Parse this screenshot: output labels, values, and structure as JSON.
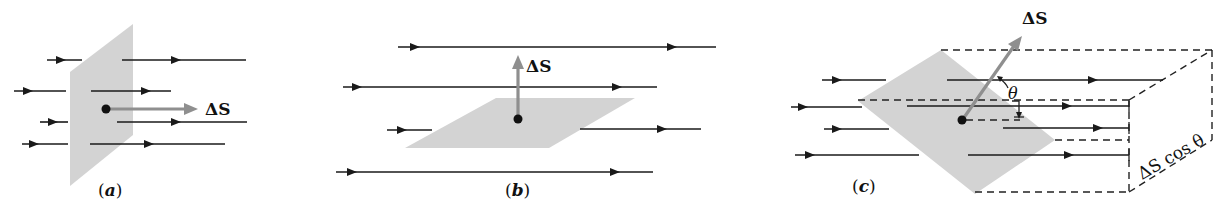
{
  "figure": {
    "panels": [
      {
        "id": "a",
        "caption_open": "(",
        "caption_letter": "a",
        "caption_close": ")",
        "vector_label": "ΔS",
        "description": "Surface perpendicular to field lines; area vector parallel to field"
      },
      {
        "id": "b",
        "caption_open": "(",
        "caption_letter": "b",
        "caption_close": ")",
        "vector_label": "ΔS",
        "description": "Surface parallel to field lines; area vector perpendicular to field"
      },
      {
        "id": "c",
        "caption_open": "(",
        "caption_letter": "c",
        "caption_close": ")",
        "vector_label": "ΔS",
        "angle_label": "θ",
        "projection_label": "ΔS cos θ",
        "description": "Surface tilted at angle θ; projected area ΔS cos θ"
      }
    ],
    "colors": {
      "plane": "#d3d3d3",
      "vector": "#8f8f8f",
      "lines": "#1a1a1a"
    }
  }
}
